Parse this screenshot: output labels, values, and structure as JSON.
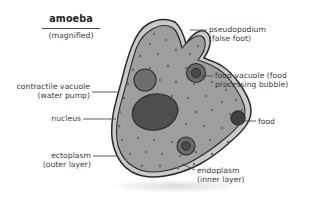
{
  "title": {
    "main": "amoeba",
    "sub": "(magnified)"
  },
  "labels": {
    "pseudopodium": {
      "line1": "pseudopodium",
      "line2": "(false foot)"
    },
    "food_vacuole": {
      "line1": "food vacuole (food",
      "line2": "processing bubble)"
    },
    "food": {
      "line1": "food"
    },
    "endoplasm": {
      "line1": "endoplasm",
      "line2": "(inner layer)"
    },
    "ectoplasm": {
      "line1": "ectoplasm",
      "line2": "(outer layer)"
    },
    "nucleus": {
      "line1": "nucleus"
    },
    "contractile_vacuole": {
      "line1": "contractile vacuole",
      "line2": "(water pump)"
    }
  },
  "colors": {
    "background": "#ffffff",
    "text": "#3a3a3a",
    "title_text": "#262626",
    "leader_line": "#4a4a4a",
    "cell_outline": "#2b2b2b",
    "ectoplasm_fill": "#c9c9c9",
    "endoplasm_fill": "#9a9a9a",
    "nucleus_fill": "#4e4e4e",
    "contractile_vacuole_fill": "#6e6e6e",
    "food_vacuole_fill": "#6a6a6a",
    "food_particle_fill": "#3f3f3f",
    "granule_fill": "#6b6b6b",
    "shadow": "#e8e8e8"
  },
  "diagram": {
    "type": "labeled-biology-diagram",
    "parts": [
      "pseudopodium (false foot)",
      "food vacuole (food processing bubble)",
      "food",
      "endoplasm (inner layer)",
      "ectoplasm (outer layer)",
      "nucleus",
      "contractile vacuole (water pump)"
    ]
  }
}
